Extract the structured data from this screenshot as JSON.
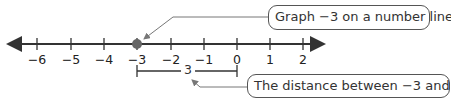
{
  "number_line": {
    "ticks": [
      {
        "value": -6,
        "label": "−6",
        "x": 37
      },
      {
        "value": -5,
        "label": "−5",
        "x": 71
      },
      {
        "value": -4,
        "label": "−4",
        "x": 104
      },
      {
        "value": -3,
        "label": "−3",
        "x": 137
      },
      {
        "value": -2,
        "label": "−2",
        "x": 171
      },
      {
        "value": -1,
        "label": "−1",
        "x": 204
      },
      {
        "value": 0,
        "label": "0",
        "x": 237
      },
      {
        "value": 1,
        "label": "1",
        "x": 270
      },
      {
        "value": 2,
        "label": "2",
        "x": 303
      }
    ],
    "plotted_point": {
      "value": -3,
      "color": "#666666"
    },
    "line_color": "#333333"
  },
  "distance_bracket": {
    "from": -3,
    "to": 0,
    "label": "3"
  },
  "callouts": {
    "top": "Graph −3 on a number line.",
    "bottom": "The distance between −3 and 0 is 3."
  }
}
